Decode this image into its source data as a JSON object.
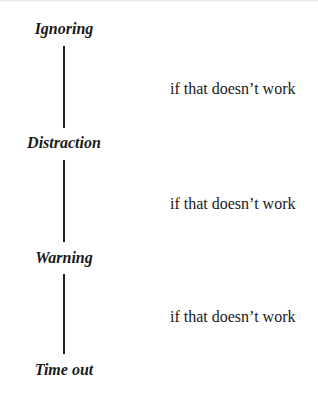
{
  "diagram": {
    "type": "escalation-flow",
    "steps": [
      {
        "label": "Ignoring"
      },
      {
        "label": "Distraction"
      },
      {
        "label": "Warning"
      },
      {
        "label": "Time out"
      }
    ],
    "transitions": [
      {
        "from": "Ignoring",
        "to": "Distraction",
        "label": "if that doesn’t work"
      },
      {
        "from": "Distraction",
        "to": "Warning",
        "label": "if that doesn’t work"
      },
      {
        "from": "Warning",
        "to": "Time out",
        "label": "if that doesn’t work"
      }
    ],
    "colors": {
      "text": "#1a1a1a",
      "connector": "#222222",
      "background": "#ffffff"
    }
  }
}
